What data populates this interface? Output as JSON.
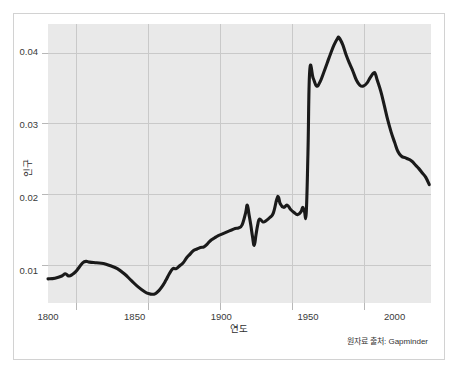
{
  "figure": {
    "background_color": "#ffffff",
    "panel_color": "#e9e9e9",
    "frame_color": "#d2d2d2",
    "line_color": "#1a1a1a",
    "grid_color": "#c9c9c9"
  },
  "caption": {
    "source_note": "원자료 출처: Gapminder"
  },
  "chart_data": {
    "type": "line",
    "title": "",
    "xlabel": "연도",
    "ylabel": "인구",
    "xlim": [
      1800,
      2021
    ],
    "ylim": [
      0.0055,
      0.0437
    ],
    "xticks": [
      1800,
      1850,
      1900,
      1950,
      2000
    ],
    "xtick_labels": [
      "1800",
      "1850",
      "1900",
      "1950",
      "2000"
    ],
    "yticks": [
      0.01,
      0.02,
      0.03,
      0.04
    ],
    "ytick_labels": [
      "0.01",
      "0.02",
      "0.03",
      "0.04"
    ],
    "grid": true,
    "legend": null,
    "series": [
      {
        "name": "인구",
        "x": [
          1800,
          1804,
          1808,
          1810,
          1812,
          1814,
          1816,
          1818,
          1820,
          1822,
          1824,
          1828,
          1832,
          1836,
          1840,
          1844,
          1848,
          1852,
          1856,
          1858,
          1860,
          1862,
          1864,
          1866,
          1868,
          1870,
          1872,
          1874,
          1876,
          1878,
          1880,
          1882,
          1884,
          1886,
          1888,
          1890,
          1892,
          1894,
          1896,
          1898,
          1900,
          1902,
          1904,
          1906,
          1908,
          1910,
          1912,
          1914,
          1915,
          1916,
          1917,
          1918,
          1919,
          1920,
          1921,
          1922,
          1924,
          1926,
          1928,
          1930,
          1932,
          1933,
          1934,
          1936,
          1938,
          1940,
          1942,
          1944,
          1946,
          1947,
          1948,
          1949,
          1950,
          1951,
          1953,
          1955,
          1957,
          1959,
          1961,
          1963,
          1965,
          1967,
          1968,
          1970,
          1972,
          1974,
          1976,
          1978,
          1980,
          1982,
          1984,
          1986,
          1988,
          1989,
          1990,
          1992,
          1994,
          1996,
          1998,
          2000,
          2002,
          2004,
          2006,
          2008,
          2010,
          2012,
          2014,
          2016,
          2018,
          2020
        ],
        "y": [
          0.0088,
          0.0089,
          0.0092,
          0.0095,
          0.0092,
          0.0094,
          0.0098,
          0.0104,
          0.011,
          0.0112,
          0.0111,
          0.011,
          0.0109,
          0.0106,
          0.0102,
          0.0095,
          0.0086,
          0.0077,
          0.007,
          0.0068,
          0.0067,
          0.0068,
          0.0072,
          0.0078,
          0.0086,
          0.0095,
          0.0102,
          0.0102,
          0.0106,
          0.011,
          0.0117,
          0.0122,
          0.0127,
          0.0129,
          0.0131,
          0.0132,
          0.0136,
          0.0141,
          0.0144,
          0.0147,
          0.0149,
          0.0151,
          0.0153,
          0.0155,
          0.0157,
          0.0158,
          0.0162,
          0.0178,
          0.0189,
          0.0176,
          0.0162,
          0.0146,
          0.0134,
          0.0148,
          0.0162,
          0.017,
          0.0166,
          0.0168,
          0.0172,
          0.0178,
          0.0197,
          0.02,
          0.0191,
          0.0186,
          0.0189,
          0.0183,
          0.0179,
          0.0176,
          0.018,
          0.0186,
          0.018,
          0.0178,
          0.026,
          0.0372,
          0.0363,
          0.0352,
          0.0358,
          0.037,
          0.0383,
          0.0396,
          0.0408,
          0.0417,
          0.0418,
          0.0409,
          0.0395,
          0.0383,
          0.0372,
          0.036,
          0.0353,
          0.0352,
          0.0356,
          0.0364,
          0.037,
          0.0368,
          0.036,
          0.0345,
          0.0326,
          0.0306,
          0.0289,
          0.0275,
          0.0262,
          0.0256,
          0.0254,
          0.0252,
          0.0249,
          0.0244,
          0.0239,
          0.0233,
          0.0227,
          0.0217
        ]
      }
    ]
  }
}
